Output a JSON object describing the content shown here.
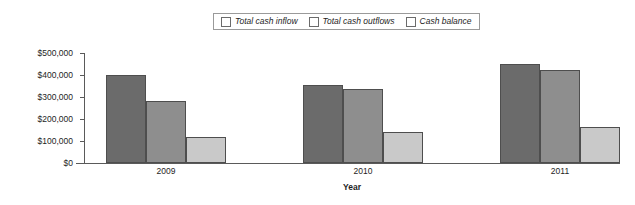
{
  "chart_data": {
    "type": "bar",
    "title": "",
    "subtitle": "",
    "xlabel": "Year",
    "ylabel": "",
    "categories": [
      "2009",
      "2010",
      "2011"
    ],
    "series": [
      {
        "name": "Total cash inflow",
        "color": "#6b6b6b",
        "values": [
          400000,
          355000,
          450000
        ]
      },
      {
        "name": "Total cash outflows",
        "color": "#8e8e8e",
        "values": [
          280000,
          338000,
          425000
        ]
      },
      {
        "name": "Cash balance",
        "color": "#c9c9c9",
        "values": [
          120000,
          143000,
          165000
        ]
      }
    ],
    "ylim": [
      0,
      500000
    ],
    "yticks": [
      0,
      100000,
      200000,
      300000,
      400000,
      500000
    ],
    "ytick_labels": [
      "$0",
      "$100,000",
      "$200,000",
      "$300,000",
      "$400,000",
      "$500,000"
    ],
    "grid": false,
    "legend_position": "top-center",
    "legend_entries": [
      "Total cash inflow",
      "Total cash outflows",
      "Cash balance"
    ]
  },
  "axis": {
    "x_title": "Year"
  }
}
